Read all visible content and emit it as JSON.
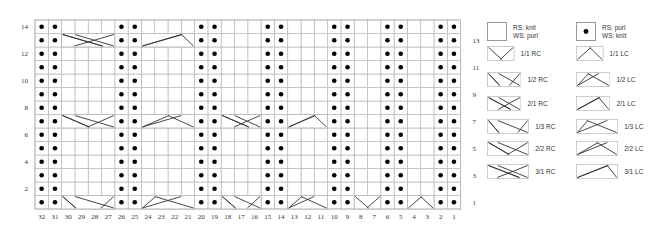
{
  "chart": {
    "columns": 32,
    "rows": 14,
    "purl_columns": [
      32,
      31,
      26,
      25,
      20,
      19,
      15,
      14,
      10,
      9,
      6,
      5,
      2,
      1
    ],
    "column_labels": [
      "32",
      "31",
      "30",
      "29",
      "28",
      "27",
      "26",
      "25",
      "24",
      "23",
      "22",
      "21",
      "20",
      "19",
      "18",
      "17",
      "16",
      "15",
      "14",
      "13",
      "12",
      "11",
      "10",
      "9",
      "8",
      "7",
      "6",
      "5",
      "4",
      "3",
      "2",
      "1"
    ],
    "left_row_labels": [
      {
        "row": 14,
        "label": "14"
      },
      {
        "row": 12,
        "label": "12"
      },
      {
        "row": 10,
        "label": "10"
      },
      {
        "row": 8,
        "label": "8"
      },
      {
        "row": 6,
        "label": "6"
      },
      {
        "row": 4,
        "label": "4"
      },
      {
        "row": 2,
        "label": "2"
      }
    ],
    "right_row_labels": [
      {
        "row": 13,
        "label": "13"
      },
      {
        "row": 11,
        "label": "11"
      },
      {
        "row": 9,
        "label": "9"
      },
      {
        "row": 7,
        "label": "7"
      },
      {
        "row": 5,
        "label": "5"
      },
      {
        "row": 3,
        "label": "3"
      },
      {
        "row": 1,
        "label": "1"
      }
    ],
    "cables": [
      {
        "row": 13,
        "from_col": 30,
        "to_col": 27,
        "type": "3/1 RC"
      },
      {
        "row": 13,
        "from_col": 24,
        "to_col": 21,
        "type": "3/1 LC"
      },
      {
        "row": 7,
        "from_col": 30,
        "to_col": 27,
        "type": "2/2 RC"
      },
      {
        "row": 7,
        "from_col": 24,
        "to_col": 21,
        "type": "2/2 LC"
      },
      {
        "row": 7,
        "from_col": 18,
        "to_col": 16,
        "type": "2/1 RC"
      },
      {
        "row": 7,
        "from_col": 13,
        "to_col": 11,
        "type": "2/1 LC"
      },
      {
        "row": 1,
        "from_col": 30,
        "to_col": 27,
        "type": "1/3 RC"
      },
      {
        "row": 1,
        "from_col": 24,
        "to_col": 21,
        "type": "1/3 LC"
      },
      {
        "row": 1,
        "from_col": 18,
        "to_col": 16,
        "type": "1/2 RC"
      },
      {
        "row": 1,
        "from_col": 13,
        "to_col": 11,
        "type": "1/2 LC"
      },
      {
        "row": 1,
        "from_col": 8,
        "to_col": 7,
        "type": "1/1 RC"
      },
      {
        "row": 1,
        "from_col": 4,
        "to_col": 3,
        "type": "1/1 LC"
      }
    ]
  },
  "legend": {
    "knit": {
      "line1": "RS: knit",
      "line2": "WS: purl"
    },
    "purl": {
      "line1": "RS: purl",
      "line2": "WS: knit"
    },
    "items": [
      {
        "rc": "1/1 RC",
        "lc": "1/1 LC",
        "width": 2
      },
      {
        "rc": "1/2 RC",
        "lc": "1/2 LC",
        "width": 3
      },
      {
        "rc": "2/1 RC",
        "lc": "2/1 LC",
        "width": 3
      },
      {
        "rc": "1/3 RC",
        "lc": "1/3 LC",
        "width": 4
      },
      {
        "rc": "2/2 RC",
        "lc": "2/2 LC",
        "width": 4
      },
      {
        "rc": "3/1 RC",
        "lc": "3/1 LC",
        "width": 4
      }
    ]
  },
  "colors": {
    "grid": "#b8b8b8",
    "line": "#333333",
    "dot": "#000000",
    "text": "#333333"
  }
}
